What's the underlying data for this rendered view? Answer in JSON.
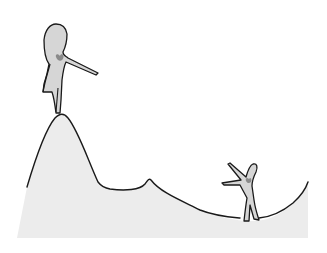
{
  "illustration": {
    "description": "Hand-drawn sketch: a large figure standing atop a tall mountain peak pointing down toward a small figure in a valley who reaches upward",
    "colors": {
      "background": "#ffffff",
      "ground_fill": "#ececec",
      "outline": "#1a1a1a",
      "figure_fill": "#d4d4d4",
      "heart": "#8a8a8a"
    },
    "figures": [
      {
        "name": "large-figure",
        "position": "on mountain peak",
        "pose": "pointing arm outstretched down-right",
        "has_heart": true
      },
      {
        "name": "small-figure",
        "position": "in valley",
        "pose": "arms reaching up-left",
        "has_heart": true
      }
    ]
  }
}
